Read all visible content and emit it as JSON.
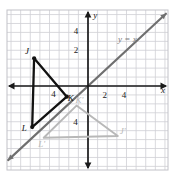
{
  "chart_data": {
    "type": "scatter",
    "title": "",
    "xlabel": "x",
    "ylabel": "y",
    "xlim": [
      -8.5,
      8.5
    ],
    "ylim": [
      -9,
      8.5
    ],
    "grid": true,
    "x_tick_labels": [
      "4",
      "2",
      "2",
      "4"
    ],
    "y_tick_labels": [
      "4",
      "2",
      "4"
    ],
    "x_ticks_shown": [
      -4,
      2,
      4
    ],
    "y_ticks_shown": [
      4,
      2,
      -4
    ],
    "annotations": [
      {
        "name": "line-label",
        "text": "y = x",
        "x": 4.1,
        "y": 4.9
      },
      {
        "name": "x-axis-label",
        "text": "x",
        "x": 7.8,
        "y": -0.75
      },
      {
        "name": "y-axis-label",
        "text": "y",
        "x": 0.75,
        "y": 7.6
      },
      {
        "name": "x-tick-neg4",
        "text": "4",
        "x": -3.6,
        "y": -1.25
      },
      {
        "name": "x-tick-2",
        "text": "2",
        "x": 1.75,
        "y": -1.3
      },
      {
        "name": "x-tick-4",
        "text": "4",
        "x": 3.75,
        "y": -1.3
      },
      {
        "name": "y-tick-4",
        "text": "4",
        "x": -1.25,
        "y": 5.85
      },
      {
        "name": "y-tick-2",
        "text": "2",
        "x": -1.25,
        "y": 3.75
      },
      {
        "name": "y-tick-neg4",
        "text": "4",
        "x": -1.3,
        "y": -4.4
      }
    ],
    "series": [
      {
        "name": "Triangle JKL (preimage)",
        "color": "#111111",
        "closed": true,
        "points": [
          {
            "label": "J",
            "x": -5.6,
            "y": 3.1,
            "label_dx": -7,
            "label_dy": -4
          },
          {
            "label": "K",
            "x": -2.2,
            "y": -1.2,
            "label_dx": 4,
            "label_dy": 4
          },
          {
            "label": "L",
            "x": -5.8,
            "y": -4.6,
            "label_dx": -8,
            "label_dy": 4
          }
        ]
      },
      {
        "name": "Triangle J'K'L' (image, reflection over y = x)",
        "color": "#b8b8b8",
        "closed": true,
        "points": [
          {
            "label": "J'",
            "x": 3.1,
            "y": -5.6,
            "label_dx": 5,
            "label_dy": -2
          },
          {
            "label": "K'",
            "x": -1.2,
            "y": -2.2,
            "label_dx": 3,
            "label_dy": -3
          },
          {
            "label": "L'",
            "x": -4.6,
            "y": -5.8,
            "label_dx": -2,
            "label_dy": 9
          }
        ]
      }
    ],
    "lines": [
      {
        "name": "line-y-equals-x",
        "equation": "y = x",
        "color": "#6f6f6f",
        "from": {
          "x": -8.3,
          "y": -8.3
        },
        "to": {
          "x": 8.1,
          "y": 8.1
        },
        "double_arrow": true
      }
    ]
  }
}
